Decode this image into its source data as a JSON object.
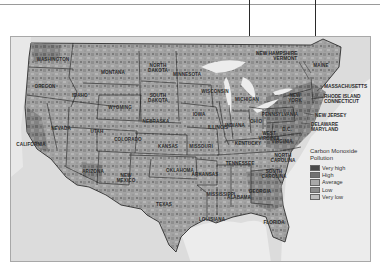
{
  "figure": {
    "type": "choropleth-map",
    "region": "Contiguous United States (county level)"
  },
  "legend": {
    "title": "Carbon Monoxide\nPollution",
    "items": [
      {
        "label": "Very high",
        "color": "#4a4a4a"
      },
      {
        "label": "High",
        "color": "#727272"
      },
      {
        "label": "Average",
        "color": "#a9a9a9"
      },
      {
        "label": "Low",
        "color": "#8c8c8c"
      },
      {
        "label": "Very low",
        "color": "#bdbdbd"
      }
    ]
  },
  "colors": {
    "land_base": "#a6a6a6",
    "water": "#e6e6e6",
    "border": "#1e1e1e",
    "neighbors": "#d4d4d4"
  },
  "callouts": [
    {
      "id": "nh-vt",
      "text": "NEW HAMPSHIRE\nVERMONT"
    },
    {
      "id": "ma",
      "text": "MASSACHUSETTS"
    },
    {
      "id": "ri-ct",
      "text": "RHODE ISLAND\nCONNECTICUT"
    },
    {
      "id": "nj",
      "text": "NEW JERSEY"
    },
    {
      "id": "de-md",
      "text": "DELAWARE\nMARYLAND"
    }
  ],
  "states": [
    {
      "name": "WASHINGTON",
      "x": 42,
      "y": 22
    },
    {
      "name": "OREGON",
      "x": 34,
      "y": 49
    },
    {
      "name": "IDAHO",
      "x": 69,
      "y": 58
    },
    {
      "name": "MONTANA",
      "x": 102,
      "y": 35
    },
    {
      "name": "WYOMING",
      "x": 109,
      "y": 70
    },
    {
      "name": "NORTH\nDAKOTA",
      "x": 147,
      "y": 31
    },
    {
      "name": "SOUTH\nDAKOTA",
      "x": 147,
      "y": 61
    },
    {
      "name": "MINNESOTA",
      "x": 176,
      "y": 37
    },
    {
      "name": "NEBRASKA",
      "x": 145,
      "y": 84
    },
    {
      "name": "NEVADA",
      "x": 50,
      "y": 91
    },
    {
      "name": "UTAH",
      "x": 86,
      "y": 94
    },
    {
      "name": "COLORADO",
      "x": 117,
      "y": 102
    },
    {
      "name": "KANSAS",
      "x": 157,
      "y": 109
    },
    {
      "name": "CALIFORNIA",
      "x": 20,
      "y": 107
    },
    {
      "name": "ARIZONA",
      "x": 82,
      "y": 134
    },
    {
      "name": "NEW\nMEXICO",
      "x": 115,
      "y": 141
    },
    {
      "name": "OKLAHOMA",
      "x": 169,
      "y": 133
    },
    {
      "name": "TEXAS",
      "x": 153,
      "y": 167
    },
    {
      "name": "WISCONSIN",
      "x": 204,
      "y": 54
    },
    {
      "name": "IOWA",
      "x": 188,
      "y": 77
    },
    {
      "name": "ILLINOIS",
      "x": 207,
      "y": 90
    },
    {
      "name": "MISSOURI",
      "x": 190,
      "y": 109
    },
    {
      "name": "MICHIGAN",
      "x": 236,
      "y": 62
    },
    {
      "name": "INDIANA",
      "x": 224,
      "y": 88
    },
    {
      "name": "OHIO",
      "x": 245,
      "y": 84
    },
    {
      "name": "KENTUCKY",
      "x": 237,
      "y": 106
    },
    {
      "name": "ARKANSAS",
      "x": 194,
      "y": 137
    },
    {
      "name": "TENNESSEE",
      "x": 229,
      "y": 126
    },
    {
      "name": "MISSISSIPPI",
      "x": 210,
      "y": 157
    },
    {
      "name": "ALABAMA",
      "x": 228,
      "y": 160
    },
    {
      "name": "LOUISIANA",
      "x": 201,
      "y": 182
    },
    {
      "name": "GEORGIA",
      "x": 249,
      "y": 154
    },
    {
      "name": "FLORIDA",
      "x": 263,
      "y": 185
    },
    {
      "name": "SOUTH\nCAROLINA",
      "x": 263,
      "y": 137
    },
    {
      "name": "NORTH\nCAROLINA",
      "x": 272,
      "y": 121
    },
    {
      "name": "VIRGINIA",
      "x": 271,
      "y": 104
    },
    {
      "name": "WEST\nVIRGINIA",
      "x": 258,
      "y": 99
    },
    {
      "name": "PENNSYLVANIA",
      "x": 269,
      "y": 77
    },
    {
      "name": "NEW\nYORK",
      "x": 284,
      "y": 61
    },
    {
      "name": "MAINE",
      "x": 310,
      "y": 28
    },
    {
      "name": "D.C.",
      "x": 276,
      "y": 92
    }
  ]
}
